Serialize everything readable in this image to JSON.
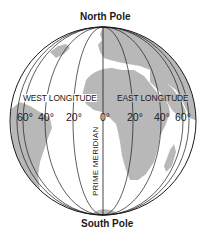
{
  "diagram": {
    "title_top": "North Pole",
    "title_bottom": "South Pole",
    "west_label": "WEST LONGITUDE",
    "east_label": "EAST LONGITUDE",
    "prime_meridian_label": "PRIME MERIDIAN",
    "degree_labels": {
      "w60": "60°",
      "w40": "40°",
      "w20": "20°",
      "zero": "0°",
      "e20": "20°",
      "e40": "40°",
      "e60": "60°"
    },
    "colors": {
      "land": "#b8b8b8",
      "ocean": "#ffffff",
      "lines": "#1a1a1a",
      "text": "#1a1a1a"
    }
  }
}
